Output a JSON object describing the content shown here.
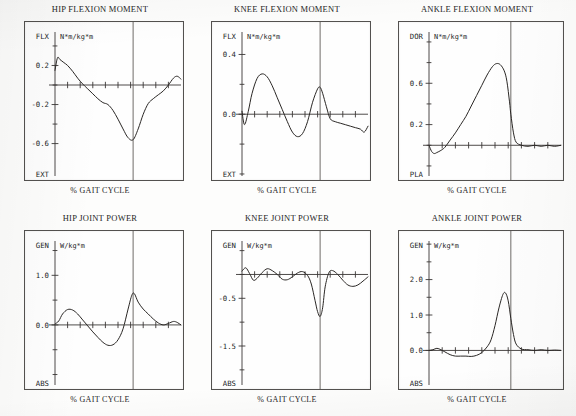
{
  "figure": {
    "kind": "gait-analysis-kinetics-panel",
    "rows": 2,
    "columns": 3,
    "xlabel_common": "%  GAIT CYCLE"
  },
  "panels": [
    {
      "id": "hip-flexion-moment",
      "title": "HIP FLEXION MOMENT",
      "unit": "N*m/kg*m",
      "top_label": "FLX",
      "bottom_label": "EXT",
      "xlabel": "%  GAIT CYCLE",
      "yticks": [
        "0.2",
        "",
        "-0.2",
        "",
        "-0.6"
      ]
    },
    {
      "id": "knee-flexion-moment",
      "title": "KNEE FLEXION MOMENT",
      "unit": "N*m/kg*m",
      "top_label": "FLX",
      "bottom_label": "EXT",
      "xlabel": "%  GAIT CYCLE",
      "yticks": [
        "0.4",
        "",
        "0.0",
        "",
        ""
      ]
    },
    {
      "id": "ankle-flexion-moment",
      "title": "ANKLE FLEXION MOMENT",
      "unit": "N*m/kg*m",
      "top_label": "DOR",
      "bottom_label": "PLA",
      "xlabel": "%  GAIT CYCLE",
      "yticks": [
        "",
        "0.6",
        "",
        "0.2",
        ""
      ]
    },
    {
      "id": "hip-joint-power",
      "title": "HIP JOINT POWER",
      "unit": "W/kg*m",
      "top_label": "GEN",
      "bottom_label": "ABS",
      "xlabel": "%  GAIT CYCLE",
      "yticks": [
        "1.0",
        "",
        "0.0",
        "",
        ""
      ]
    },
    {
      "id": "knee-joint-power",
      "title": "KNEE JOINT POWER",
      "unit": "W/kg*m",
      "top_label": "GEN",
      "bottom_label": "ABS",
      "xlabel": "%  GAIT CYCLE",
      "yticks": [
        "",
        "-0.5",
        "",
        "-1.5",
        ""
      ]
    },
    {
      "id": "ankle-joint-power",
      "title": "ANKLE JOINT POWER",
      "unit": "W/kg*m",
      "top_label": "GEN",
      "bottom_label": "ABS",
      "xlabel": "%  GAIT CYCLE",
      "yticks": [
        "2.0",
        "",
        "1.0",
        "",
        "0.0"
      ]
    }
  ],
  "chart_data": [
    {
      "type": "line",
      "id": "hip-flexion-moment",
      "title": "HIP FLEXION MOMENT",
      "xlabel": "%  GAIT CYCLE",
      "ylabel": "N*m/kg*m",
      "y_positive_direction": "FLX",
      "y_negative_direction": "EXT",
      "xlim": [
        0,
        100
      ],
      "ylim": [
        -0.85,
        0.42
      ],
      "yticks": [
        0.2,
        -0.2,
        -0.6
      ],
      "ytick_labels": [
        "0.2",
        "-0.2",
        "-0.6"
      ],
      "grid": false,
      "legend": "none",
      "annotations": [
        {
          "type": "vertical-event-line",
          "x": 62,
          "label": "toe-off"
        }
      ],
      "x": [
        0,
        2,
        4,
        7,
        10,
        14,
        18,
        22,
        26,
        30,
        34,
        38,
        42,
        46,
        50,
        54,
        58,
        62,
        66,
        70,
        74,
        78,
        82,
        86,
        90,
        94,
        97,
        100
      ],
      "y": [
        0.15,
        0.28,
        0.26,
        0.23,
        0.2,
        0.14,
        0.07,
        0.01,
        -0.04,
        -0.09,
        -0.14,
        -0.18,
        -0.2,
        -0.26,
        -0.35,
        -0.45,
        -0.54,
        -0.56,
        -0.45,
        -0.3,
        -0.19,
        -0.14,
        -0.1,
        -0.06,
        0.0,
        0.07,
        0.09,
        0.06
      ]
    },
    {
      "type": "line",
      "id": "knee-flexion-moment",
      "title": "KNEE FLEXION MOMENT",
      "xlabel": "%  GAIT CYCLE",
      "ylabel": "N*m/kg*m",
      "y_positive_direction": "FLX",
      "y_negative_direction": "EXT",
      "xlim": [
        0,
        100
      ],
      "ylim": [
        -0.36,
        0.47
      ],
      "yticks": [
        0.4,
        0.0
      ],
      "ytick_labels": [
        "0.4",
        "0.0"
      ],
      "grid": false,
      "legend": "none",
      "annotations": [
        {
          "type": "vertical-event-line",
          "x": 62,
          "label": "toe-off"
        }
      ],
      "x": [
        0,
        2,
        5,
        8,
        12,
        16,
        20,
        24,
        28,
        32,
        36,
        40,
        44,
        48,
        52,
        56,
        60,
        62,
        64,
        67,
        70,
        74,
        78,
        82,
        86,
        90,
        94,
        97,
        100
      ],
      "y": [
        0.02,
        -0.07,
        0.02,
        0.14,
        0.24,
        0.27,
        0.25,
        0.19,
        0.11,
        0.03,
        -0.05,
        -0.12,
        -0.15,
        -0.13,
        -0.05,
        0.08,
        0.17,
        0.18,
        0.14,
        0.05,
        -0.03,
        -0.05,
        -0.06,
        -0.07,
        -0.08,
        -0.09,
        -0.1,
        -0.12,
        -0.08
      ]
    },
    {
      "type": "line",
      "id": "ankle-flexion-moment",
      "title": "ANKLE FLEXION MOMENT",
      "xlabel": "%  GAIT CYCLE",
      "ylabel": "N*m/kg*m",
      "y_positive_direction": "DOR",
      "y_negative_direction": "PLA",
      "xlim": [
        0,
        100
      ],
      "ylim": [
        -0.22,
        0.98
      ],
      "yticks": [
        0.6,
        0.2
      ],
      "ytick_labels": [
        "0.6",
        "0.2"
      ],
      "grid": false,
      "legend": "none",
      "annotations": [
        {
          "type": "vertical-event-line",
          "x": 62,
          "label": "toe-off"
        }
      ],
      "x": [
        0,
        2,
        4,
        6,
        9,
        12,
        16,
        20,
        24,
        28,
        32,
        36,
        40,
        44,
        48,
        51,
        54,
        57,
        59,
        61,
        62,
        64,
        66,
        70,
        75,
        80,
        85,
        90,
        95,
        100
      ],
      "y": [
        0.0,
        -0.06,
        -0.08,
        -0.07,
        -0.05,
        -0.02,
        0.05,
        0.12,
        0.2,
        0.28,
        0.38,
        0.48,
        0.58,
        0.68,
        0.76,
        0.79,
        0.78,
        0.72,
        0.62,
        0.42,
        0.3,
        0.12,
        0.03,
        0.0,
        -0.01,
        0.0,
        -0.01,
        0.0,
        -0.01,
        0.0
      ]
    },
    {
      "type": "line",
      "id": "hip-joint-power",
      "title": "HIP JOINT POWER",
      "xlabel": "%  GAIT CYCLE",
      "ylabel": "W/kg*m",
      "y_positive_direction": "GEN",
      "y_negative_direction": "ABS",
      "xlim": [
        0,
        100
      ],
      "ylim": [
        -1.05,
        1.45
      ],
      "yticks": [
        1.0,
        0.0
      ],
      "ytick_labels": [
        "1.0",
        "0.0"
      ],
      "grid": false,
      "legend": "none",
      "annotations": [
        {
          "type": "vertical-event-line",
          "x": 62,
          "label": "toe-off"
        }
      ],
      "x": [
        0,
        3,
        6,
        10,
        14,
        18,
        22,
        26,
        30,
        34,
        38,
        42,
        46,
        50,
        54,
        58,
        61,
        63,
        66,
        70,
        74,
        78,
        82,
        86,
        90,
        94,
        97,
        100
      ],
      "y": [
        0.02,
        0.08,
        0.22,
        0.31,
        0.3,
        0.22,
        0.1,
        -0.02,
        -0.14,
        -0.25,
        -0.35,
        -0.41,
        -0.4,
        -0.3,
        -0.08,
        0.32,
        0.6,
        0.63,
        0.46,
        0.32,
        0.22,
        0.12,
        0.04,
        0.0,
        0.03,
        0.07,
        0.05,
        0.0
      ]
    },
    {
      "type": "line",
      "id": "knee-joint-power",
      "title": "KNEE JOINT POWER",
      "xlabel": "%  GAIT CYCLE",
      "ylabel": "W/kg*m",
      "y_positive_direction": "GEN",
      "y_negative_direction": "ABS",
      "xlim": [
        0,
        100
      ],
      "ylim": [
        -2.15,
        0.45
      ],
      "yticks": [
        -0.5,
        -1.5
      ],
      "ytick_labels": [
        "-0.5",
        "-1.5"
      ],
      "grid": false,
      "legend": "none",
      "annotations": [
        {
          "type": "vertical-event-line",
          "x": 62,
          "label": "toe-off"
        }
      ],
      "x": [
        0,
        3,
        6,
        9,
        12,
        16,
        20,
        24,
        28,
        32,
        36,
        40,
        44,
        48,
        52,
        55,
        58,
        60,
        62,
        64,
        66,
        69,
        72,
        76,
        80,
        84,
        88,
        92,
        96,
        100
      ],
      "y": [
        0.07,
        0.14,
        0.02,
        -0.12,
        -0.08,
        0.04,
        0.12,
        0.08,
        0.0,
        -0.1,
        -0.11,
        -0.05,
        0.03,
        0.06,
        -0.02,
        -0.2,
        -0.55,
        -0.78,
        -0.88,
        -0.7,
        -0.26,
        0.04,
        0.08,
        0.0,
        -0.12,
        -0.22,
        -0.25,
        -0.22,
        -0.14,
        -0.05
      ]
    },
    {
      "type": "line",
      "id": "ankle-joint-power",
      "title": "ANKLE JOINT POWER",
      "xlabel": "%  GAIT CYCLE",
      "ylabel": "W/kg*m",
      "y_positive_direction": "GEN",
      "y_negative_direction": "ABS",
      "xlim": [
        0,
        100
      ],
      "ylim": [
        -0.75,
        2.75
      ],
      "yticks": [
        2.0,
        1.0,
        0.0
      ],
      "ytick_labels": [
        "2.0",
        "1.0",
        "0.0"
      ],
      "grid": false,
      "legend": "none",
      "annotations": [
        {
          "type": "vertical-event-line",
          "x": 62,
          "label": "toe-off"
        }
      ],
      "x": [
        0,
        3,
        6,
        9,
        12,
        16,
        20,
        24,
        28,
        32,
        36,
        40,
        44,
        47,
        50,
        53,
        56,
        58,
        60,
        62,
        64,
        66,
        70,
        75,
        80,
        85,
        90,
        95,
        100
      ],
      "y": [
        0.0,
        0.02,
        0.06,
        0.02,
        -0.04,
        -0.12,
        -0.16,
        -0.16,
        -0.16,
        -0.17,
        -0.14,
        -0.06,
        0.1,
        0.3,
        0.7,
        1.2,
        1.58,
        1.62,
        1.4,
        0.9,
        0.45,
        0.18,
        0.04,
        0.02,
        0.0,
        0.02,
        0.0,
        0.01,
        0.0
      ]
    }
  ]
}
